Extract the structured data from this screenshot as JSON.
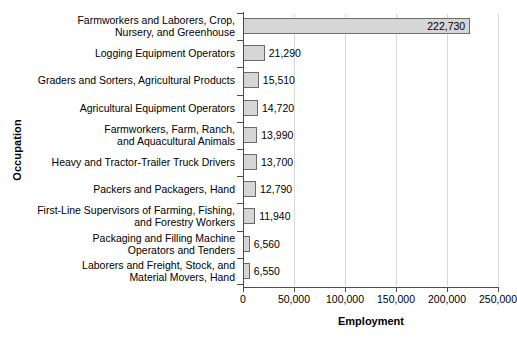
{
  "chart_data": {
    "type": "bar",
    "orientation": "horizontal",
    "title": "",
    "xlabel": "Employment",
    "ylabel": "Occupation",
    "xlim": [
      0,
      250000
    ],
    "grid": true,
    "legend": false,
    "xticks": [
      "0",
      "50,000",
      "100,000",
      "150,000",
      "200,000",
      "250,000"
    ],
    "xtick_values": [
      0,
      50000,
      100000,
      150000,
      200000,
      250000
    ],
    "categories": [
      "Farmworkers and Laborers, Crop,\nNursery, and Greenhouse",
      "Logging Equipment Operators",
      "Graders and Sorters, Agricultural Products",
      "Agricultural Equipment Operators",
      "Farmworkers, Farm, Ranch,\nand Aquacultural Animals",
      "Heavy and Tractor-Trailer Truck Drivers",
      "Packers and Packagers, Hand",
      "First-Line Supervisors of Farming, Fishing,\nand Forestry Workers",
      "Packaging and Filling Machine\nOperators and Tenders",
      "Laborers and Freight, Stock, and\nMaterial Movers, Hand"
    ],
    "values": [
      222730,
      21290,
      15510,
      14720,
      13990,
      13700,
      12790,
      11940,
      6560,
      6550
    ],
    "value_labels": [
      "222,730",
      "21,290",
      "15,510",
      "14,720",
      "13,990",
      "13,700",
      "12,790",
      "11,940",
      "6,560",
      "6,550"
    ],
    "bar_fill": "#d6d6d6",
    "bar_edge": "#6b6b6b",
    "gridline_color": "#d9d9d9",
    "axis_color": "#4d4d4d"
  }
}
